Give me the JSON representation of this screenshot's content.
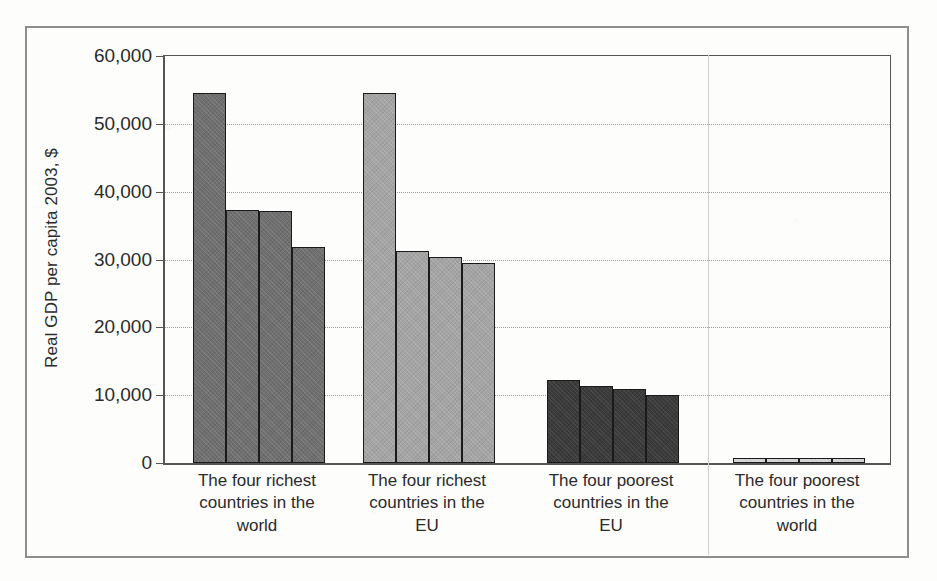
{
  "figure": {
    "frame": true
  },
  "chart_data": {
    "type": "bar",
    "title": "",
    "subtitle": "",
    "xlabel": "",
    "ylabel": "Real GDP per capita 2003, $",
    "ylim": [
      0,
      60000
    ],
    "ytick_labels": [
      "60,000",
      "50,000",
      "40,000",
      "30,000",
      "20,000",
      "10,000",
      "0"
    ],
    "ytick_values": [
      60000,
      50000,
      40000,
      30000,
      20000,
      10000,
      0
    ],
    "grid": "horizontal-dotted",
    "legend": "none",
    "categories": [
      "The four richest countries in the world",
      "The four richest countries in the EU",
      "The four poorest countries in the EU",
      "The four poorest countries in the world"
    ],
    "category_lines": [
      [
        "The four richest",
        "countries in the",
        "world"
      ],
      [
        "The four richest",
        "countries in the",
        "EU"
      ],
      [
        "The four poorest",
        "countries in the",
        "EU"
      ],
      [
        "The four poorest",
        "countries in the",
        "world"
      ]
    ],
    "groups": [
      {
        "name": "The four richest countries in the world",
        "tone": "tone-dark",
        "color": "#6f6f6f",
        "values": [
          54500,
          37300,
          37200,
          31900
        ]
      },
      {
        "name": "The four richest countries in the EU",
        "tone": "tone-light",
        "color": "#a4a4a4",
        "values": [
          54600,
          31200,
          30400,
          29500
        ]
      },
      {
        "name": "The four poorest countries in the EU",
        "tone": "tone-darkest",
        "color": "#3b3b3b",
        "values": [
          12300,
          11400,
          10900,
          10000
        ]
      },
      {
        "name": "The four poorest countries in the world",
        "tone": "tone-pale",
        "color": "#d8d8d8",
        "values": [
          700,
          650,
          620,
          600
        ]
      }
    ]
  },
  "geometry": {
    "plot_left": 163,
    "plot_top": 55,
    "plot_width": 725,
    "plot_height": 407,
    "bar_width": 33,
    "group_starts": [
      28,
      198,
      382,
      568
    ],
    "divider_x": [
      708
    ]
  }
}
